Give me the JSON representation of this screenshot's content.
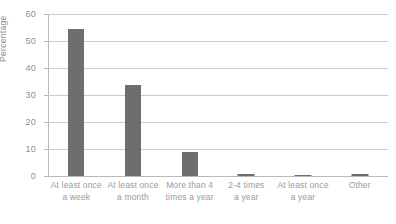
{
  "chart_data": {
    "type": "bar",
    "title": "",
    "xlabel": "",
    "ylabel": "Percentage",
    "ylim": [
      0,
      60
    ],
    "yticks": [
      0,
      10,
      20,
      30,
      40,
      50,
      60
    ],
    "grid": true,
    "legend": "none",
    "orientation": "vertical",
    "bar_color": "#6e6e6e",
    "categories": [
      "At least once a week",
      "At least once a month",
      "More than 4 times a year",
      "2-4 times a year",
      "At least once a year",
      "Other"
    ],
    "category_lines": [
      [
        "At least once",
        "a week"
      ],
      [
        "At least once",
        "a month"
      ],
      [
        "More than 4",
        "times a year"
      ],
      [
        "2-4 times",
        "a year"
      ],
      [
        "At least once",
        "a year"
      ],
      [
        "Other",
        ""
      ]
    ],
    "values": [
      54.5,
      33.7,
      8.8,
      0.6,
      0.4,
      0.7
    ]
  },
  "axis": {
    "y_title": "Percentage",
    "tick_labels": [
      "0",
      "10",
      "20",
      "30",
      "40",
      "50",
      "60"
    ]
  },
  "title_sliver": "",
  "colors": {
    "bar": "#6e6e6e",
    "gridline": "#c9c9cd",
    "axis": "#b9b9bd",
    "tick_text": "#8d8d92",
    "label_text": "#9a9a9f",
    "background": "#ffffff"
  }
}
